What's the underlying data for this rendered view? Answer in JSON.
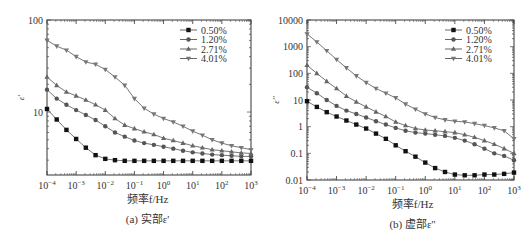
{
  "chart_data": [
    {
      "type": "line",
      "panel": "a",
      "title": "",
      "caption": "(a) 实部ε'",
      "xlabel": "频率f/Hz",
      "ylabel": "ε'",
      "xscale": "log",
      "yscale": "log",
      "xlim": [
        0.0001,
        1000
      ],
      "ylim": [
        2.07,
        100
      ],
      "x_ticks": [
        "10^-4",
        "10^-3",
        "10^-2",
        "10^-1",
        "10^0",
        "10^1",
        "10^2",
        "10^3"
      ],
      "y_ticks": [
        "10",
        "100"
      ],
      "y_tick_values": [
        10,
        100
      ],
      "grid": false,
      "legend_position": "upper right",
      "x_log": [
        -4,
        -3.667,
        -3.333,
        -3,
        -2.667,
        -2.333,
        -2,
        -1.667,
        -1.333,
        -1,
        -0.667,
        -0.333,
        0,
        0.333,
        0.667,
        1,
        1.333,
        1.667,
        2,
        2.333,
        2.667,
        3
      ],
      "series": [
        {
          "name": "0.50%",
          "marker": "square",
          "values": [
            10.8,
            8.3,
            6.4,
            5.1,
            4.1,
            3.4,
            3.1,
            3.0,
            2.95,
            2.95,
            2.95,
            2.95,
            2.95,
            2.95,
            2.95,
            2.95,
            2.95,
            2.95,
            2.95,
            2.95,
            2.95,
            2.95
          ]
        },
        {
          "name": "1.20%",
          "marker": "circle",
          "values": [
            17.5,
            14,
            12,
            10.5,
            9.3,
            8.2,
            7,
            6,
            5.4,
            4.9,
            4.6,
            4.4,
            4.2,
            4.0,
            3.8,
            3.65,
            3.55,
            3.45,
            3.4,
            3.35,
            3.3,
            3.3
          ]
        },
        {
          "name": "2.71%",
          "marker": "triangle-up",
          "values": [
            24,
            19.5,
            16.5,
            15,
            13.5,
            12,
            10.5,
            8.5,
            7.2,
            6.6,
            6.1,
            5.7,
            5.2,
            4.9,
            4.6,
            4.3,
            4.1,
            3.9,
            3.8,
            3.7,
            3.6,
            3.55
          ]
        },
        {
          "name": "4.01%",
          "marker": "triangle-down",
          "values": [
            60,
            52,
            47,
            40,
            35,
            33,
            29,
            24,
            19.5,
            14,
            11,
            9.5,
            8.5,
            7.8,
            7,
            6.2,
            5.6,
            5,
            4.6,
            4.3,
            4.1,
            3.9
          ]
        }
      ]
    },
    {
      "type": "line",
      "panel": "b",
      "title": "",
      "caption": "(b) 虚部ε''",
      "xlabel": "频率f/Hz",
      "ylabel": "ε''",
      "xscale": "log",
      "yscale": "log",
      "xlim": [
        0.0001,
        1000
      ],
      "ylim": [
        0.01,
        10000
      ],
      "x_ticks": [
        "10^-4",
        "10^-3",
        "10^-2",
        "10^-1",
        "10^0",
        "10^1",
        "10^2",
        "10^3"
      ],
      "y_ticks": [
        "0.01",
        "0.1",
        "1",
        "10",
        "100",
        "1000",
        "10000"
      ],
      "y_tick_values": [
        0.01,
        0.1,
        1,
        10,
        100,
        1000,
        10000
      ],
      "grid": false,
      "legend_position": "upper right",
      "x_log": [
        -4,
        -3.667,
        -3.333,
        -3,
        -2.667,
        -2.333,
        -2,
        -1.667,
        -1.333,
        -1,
        -0.667,
        -0.333,
        0,
        0.333,
        0.667,
        1,
        1.333,
        1.667,
        2,
        2.333,
        2.667,
        3
      ],
      "series": [
        {
          "name": "0.50%",
          "marker": "square",
          "values": [
            9,
            5.5,
            3.5,
            2.4,
            1.7,
            1.2,
            0.85,
            0.55,
            0.35,
            0.2,
            0.12,
            0.075,
            0.045,
            0.028,
            0.02,
            0.016,
            0.015,
            0.015,
            0.016,
            0.016,
            0.017,
            0.019
          ]
        },
        {
          "name": "1.20%",
          "marker": "circle",
          "values": [
            30,
            18,
            10,
            6,
            4,
            3,
            2.2,
            1.6,
            1.2,
            0.9,
            0.7,
            0.6,
            0.55,
            0.5,
            0.45,
            0.38,
            0.3,
            0.22,
            0.15,
            0.1,
            0.08,
            0.055
          ]
        },
        {
          "name": "2.71%",
          "marker": "triangle-up",
          "values": [
            200,
            100,
            50,
            27,
            14,
            8.5,
            5.5,
            3.6,
            2.4,
            1.5,
            1.1,
            0.85,
            0.75,
            0.7,
            0.65,
            0.6,
            0.5,
            0.4,
            0.3,
            0.22,
            0.15,
            0.1
          ]
        },
        {
          "name": "4.01%",
          "marker": "triangle-down",
          "values": [
            3000,
            1500,
            700,
            330,
            160,
            80,
            45,
            27,
            18,
            12,
            7,
            4.5,
            3,
            2.2,
            1.8,
            1.6,
            1.5,
            1.3,
            1.1,
            0.9,
            0.7,
            0.35
          ]
        }
      ]
    }
  ],
  "panels": {
    "a": {
      "caption": "(a) 实部ε'",
      "xlabel": "频率f/Hz",
      "ylabel": "ε'"
    },
    "b": {
      "caption": "(b) 虚部ε''",
      "xlabel": "频率f/Hz",
      "ylabel": "ε''"
    }
  },
  "colors": {
    "0.50%": "#111111",
    "1.20%": "#555555",
    "2.71%": "#666666",
    "4.01%": "#777777",
    "axis": "#333333",
    "line": "#666666"
  }
}
